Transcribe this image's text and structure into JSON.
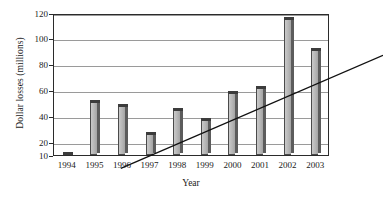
{
  "chart_data": {
    "type": "bar",
    "title": "",
    "xlabel": "Year",
    "ylabel": "Dollar losses (millions)",
    "categories": [
      "1994",
      "1995",
      "1996",
      "1997",
      "1998",
      "1999",
      "2000",
      "2001",
      "2002",
      "2003"
    ],
    "values": [
      9,
      51,
      48,
      26,
      45,
      37,
      58,
      62,
      115,
      91
    ],
    "series": [
      {
        "name": "Dollar losses",
        "values": [
          9,
          51,
          48,
          26,
          45,
          37,
          58,
          62,
          115,
          91
        ]
      },
      {
        "name": "Trend line",
        "type": "line",
        "x": [
          "1994",
          "2003"
        ],
        "values": [
          12,
          95
        ]
      }
    ],
    "ytick_labels": [
      "10",
      "20",
      "40",
      "60",
      "80",
      "100",
      "120"
    ],
    "ytick_values": [
      10,
      20,
      40,
      60,
      80,
      100,
      120
    ],
    "ylim": [
      10,
      120
    ],
    "grid": true,
    "legend": "none",
    "colors": {
      "bar_face": "#b6b6b6",
      "bar_side": "#5c5c5c",
      "bar_top": "#3c3c3c",
      "gridline": "#9a9a9a",
      "frame": "#2b2b2b",
      "trendline": "#111111"
    }
  }
}
